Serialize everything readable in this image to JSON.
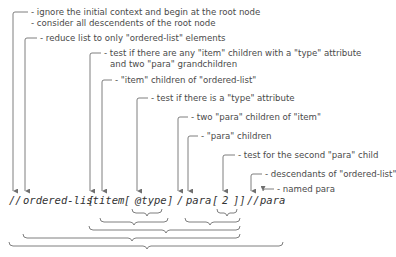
{
  "diagram": {
    "expression_tokens": [
      {
        "id": "root-slashes",
        "text": "//",
        "x": 9
      },
      {
        "id": "ordered-list",
        "text": "ordered-list",
        "x": 23
      },
      {
        "id": "open-bracket-1",
        "text": "[",
        "x": 88
      },
      {
        "id": "item",
        "text": "item",
        "x": 99
      },
      {
        "id": "open-bracket-2",
        "text": "[",
        "x": 124
      },
      {
        "id": "at-type",
        "text": "@type",
        "x": 135
      },
      {
        "id": "close-bracket-2",
        "text": "]",
        "x": 167
      },
      {
        "id": "slash",
        "text": "/",
        "x": 177
      },
      {
        "id": "para",
        "text": "para",
        "x": 186
      },
      {
        "id": "open-bracket-3",
        "text": "[",
        "x": 212
      },
      {
        "id": "two",
        "text": "2",
        "x": 222
      },
      {
        "id": "close-brackets",
        "text": "]]",
        "x": 233
      },
      {
        "id": "desc-slashes",
        "text": "//",
        "x": 247
      },
      {
        "id": "para-2",
        "text": "para",
        "x": 260
      }
    ],
    "annotations": [
      {
        "id": "ignore-context",
        "text": "- ignore the initial context and begin at the root node",
        "x": 31,
        "y": 7
      },
      {
        "id": "all-descendents",
        "text": "- consider all descendents of the root node",
        "x": 31,
        "y": 18
      },
      {
        "id": "reduce-list",
        "text": "- reduce list to only \"ordered-list\" elements",
        "x": 40,
        "y": 33
      },
      {
        "id": "test-any-item",
        "text": "- test if there are any \"item\" children with a \"type\" attribute",
        "x": 104,
        "y": 48
      },
      {
        "id": "test-any-item-2",
        "text": "and two \"para\" grandchildren",
        "x": 110,
        "y": 59
      },
      {
        "id": "item-children",
        "text": "- \"item\" children of \"ordered-list\"",
        "x": 115,
        "y": 75
      },
      {
        "id": "test-type",
        "text": "- test if there is a \"type\" attribute",
        "x": 151,
        "y": 93
      },
      {
        "id": "two-para",
        "text": "- two \"para\" children of \"item\"",
        "x": 191,
        "y": 112
      },
      {
        "id": "para-children",
        "text": "- \"para\" children",
        "x": 201,
        "y": 131
      },
      {
        "id": "test-second",
        "text": "- test for the second \"para\" child",
        "x": 238,
        "y": 150
      },
      {
        "id": "descendants",
        "text": "- descendants of \"ordered-list\"",
        "x": 265,
        "y": 169
      },
      {
        "id": "named-para",
        "text": "- named para",
        "x": 277,
        "y": 184
      }
    ],
    "colors": {
      "line": "#6f6f6f",
      "text": "#4a4a4a",
      "background": "#ffffff"
    }
  }
}
